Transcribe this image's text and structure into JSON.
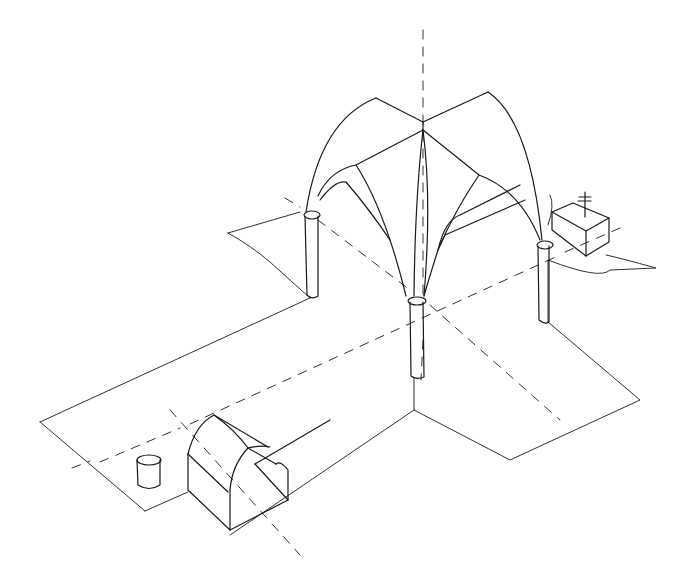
{
  "drawing": {
    "subject": "Isometric sketch of a cross-vaulted crossing with four columns, floor plan arms, dashed axes, a small box with cross marker and a small cylinder plus a gabled block",
    "stroke_color": "#1a1a1a",
    "background": "#ffffff",
    "elements": [
      {
        "name": "vertical-axis",
        "type": "dashed-line"
      },
      {
        "name": "nave-axis",
        "type": "dashed-line"
      },
      {
        "name": "transept-axis",
        "type": "dashed-line"
      },
      {
        "name": "cross-vault",
        "type": "ribbed-vault"
      },
      {
        "name": "column-left",
        "type": "column"
      },
      {
        "name": "column-center",
        "type": "column"
      },
      {
        "name": "column-right",
        "type": "column"
      },
      {
        "name": "floor-plan",
        "type": "outline"
      },
      {
        "name": "altar-box",
        "type": "box-with-cross"
      },
      {
        "name": "cylinder",
        "type": "cylinder"
      },
      {
        "name": "gabled-block",
        "type": "barrel-block"
      }
    ]
  }
}
